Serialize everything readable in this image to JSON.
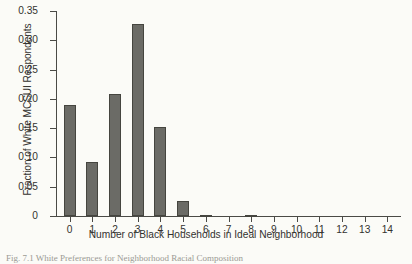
{
  "chart_data": {
    "type": "bar",
    "title": "",
    "xlabel": "Number of Black Households in Ideal Neighborhood",
    "ylabel": "Fraction of White MCSUI Respondents",
    "categories": [
      "0",
      "1",
      "2",
      "3",
      "4",
      "5",
      "6",
      "7",
      "8",
      "9",
      "10",
      "11",
      "12",
      "13",
      "14"
    ],
    "values": [
      0.19,
      0.093,
      0.208,
      0.327,
      0.152,
      0.025,
      0.002,
      0.0,
      0.001,
      0.0,
      0.0,
      0.0,
      0.0,
      0.0,
      0.0
    ],
    "xlim": [
      -0.6,
      14.6
    ],
    "ylim": [
      0,
      0.35
    ],
    "ytick_labels": [
      "0",
      "0.05",
      "0.10",
      "0.15",
      "0.20",
      "0.25",
      "0.30",
      "0.35"
    ],
    "ytick_values": [
      0,
      0.05,
      0.1,
      0.15,
      0.2,
      0.25,
      0.3,
      0.35
    ],
    "grid": false,
    "legend": false,
    "bar_color": "#6b6b66",
    "bar_edge_color": "#45453f",
    "background_color": "#fbfbf7",
    "axis_color": "#4a4a46"
  },
  "caption": {
    "text": "Fig. 7.1 White Preferences for Neighborhood Racial Composition"
  }
}
